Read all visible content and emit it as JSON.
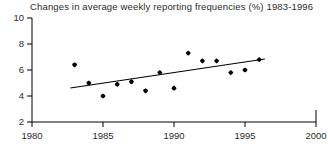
{
  "chart_data": {
    "type": "scatter",
    "title": "Changes in average weekly reporting frequencies (%) 1983-1996",
    "xlabel": "",
    "ylabel": "",
    "xlim": [
      1980,
      2000
    ],
    "ylim": [
      2,
      10
    ],
    "xticks": [
      1980,
      1985,
      1990,
      1995,
      2000
    ],
    "yticks": [
      2,
      4,
      6,
      8,
      10
    ],
    "xtick_labels": [
      "1980",
      "1985",
      "1990",
      "1995",
      "2000"
    ],
    "ytick_labels": [
      "2",
      "4",
      "6",
      "8",
      "10"
    ],
    "grid": false,
    "legend": null,
    "x": [
      1983,
      1984,
      1985,
      1986,
      1987,
      1988,
      1989,
      1990,
      1991,
      1992,
      1993,
      1994,
      1995,
      1996
    ],
    "values": [
      6.4,
      5.0,
      4.0,
      4.9,
      5.1,
      4.4,
      5.8,
      4.6,
      7.3,
      6.7,
      6.7,
      5.8,
      6.0,
      6.8
    ],
    "series": [
      {
        "name": "Average weekly reporting frequency change (%)",
        "marker": "filled-diamond",
        "color": "#000000",
        "points": [
          {
            "x": 1983,
            "y": 6.4
          },
          {
            "x": 1984,
            "y": 5.0
          },
          {
            "x": 1985,
            "y": 4.0
          },
          {
            "x": 1986,
            "y": 4.9
          },
          {
            "x": 1987,
            "y": 5.1
          },
          {
            "x": 1988,
            "y": 4.4
          },
          {
            "x": 1989,
            "y": 5.8
          },
          {
            "x": 1990,
            "y": 4.6
          },
          {
            "x": 1991,
            "y": 7.3
          },
          {
            "x": 1992,
            "y": 6.7
          },
          {
            "x": 1993,
            "y": 6.7
          },
          {
            "x": 1994,
            "y": 5.8
          },
          {
            "x": 1995,
            "y": 6.0
          },
          {
            "x": 1996,
            "y": 6.8
          }
        ]
      },
      {
        "name": "Linear trend line",
        "type": "line",
        "color": "#000000",
        "points": [
          {
            "x": 1982.7,
            "y": 4.62
          },
          {
            "x": 1996.4,
            "y": 6.85
          }
        ]
      }
    ],
    "colors": {
      "marker": "#000000",
      "trend_line": "#000000",
      "axis": "#000000",
      "background": "#ffffff"
    }
  }
}
